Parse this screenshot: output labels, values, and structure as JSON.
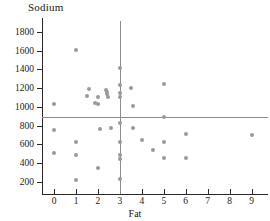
{
  "chart_data": {
    "type": "scatter",
    "title": "Sodium",
    "xlabel": "Fat",
    "ylabel": "Sodium",
    "xlim": [
      -0.55,
      9.75
    ],
    "ylim": [
      75,
      1950
    ],
    "grid": false,
    "legend": null,
    "xticks": [
      0,
      1,
      2,
      3,
      4,
      5,
      6,
      7,
      8,
      9
    ],
    "xtick_labels": [
      "0",
      "1",
      "2",
      "3",
      "4",
      "5",
      "6",
      "7",
      "8",
      "9"
    ],
    "yticks": [
      200,
      400,
      600,
      800,
      1000,
      1200,
      1400,
      1600,
      1800
    ],
    "ytick_labels": [
      "200",
      "400",
      "600",
      "800",
      "1000",
      "1200",
      "1400",
      "1600",
      "1800"
    ],
    "point_color": "#9a9a9a",
    "line_color": "#8e8e8e",
    "axis_color": "#2b2b2b",
    "reference_lines": [
      {
        "orientation": "horizontal",
        "value": 890,
        "label": "mean-sodium"
      },
      {
        "orientation": "vertical",
        "value": 3,
        "label": "mean-fat"
      }
    ],
    "points": [
      {
        "x": 0.0,
        "y": 1035
      },
      {
        "x": 0.0,
        "y": 750
      },
      {
        "x": 0.0,
        "y": 510
      },
      {
        "x": 1.0,
        "y": 1610
      },
      {
        "x": 1.0,
        "y": 630
      },
      {
        "x": 1.0,
        "y": 485
      },
      {
        "x": 1.0,
        "y": 220
      },
      {
        "x": 1.5,
        "y": 1120
      },
      {
        "x": 1.6,
        "y": 1195
      },
      {
        "x": 1.85,
        "y": 1040
      },
      {
        "x": 2.0,
        "y": 1110
      },
      {
        "x": 2.0,
        "y": 1035
      },
      {
        "x": 2.0,
        "y": 345
      },
      {
        "x": 2.1,
        "y": 765
      },
      {
        "x": 2.35,
        "y": 1185
      },
      {
        "x": 2.4,
        "y": 1160
      },
      {
        "x": 2.4,
        "y": 1135
      },
      {
        "x": 2.45,
        "y": 1110
      },
      {
        "x": 2.6,
        "y": 775
      },
      {
        "x": 3.0,
        "y": 1420
      },
      {
        "x": 3.0,
        "y": 1230
      },
      {
        "x": 3.0,
        "y": 1150
      },
      {
        "x": 3.0,
        "y": 1105
      },
      {
        "x": 3.0,
        "y": 830
      },
      {
        "x": 3.0,
        "y": 630
      },
      {
        "x": 3.0,
        "y": 490
      },
      {
        "x": 3.0,
        "y": 440
      },
      {
        "x": 3.0,
        "y": 230
      },
      {
        "x": 3.5,
        "y": 1205
      },
      {
        "x": 3.6,
        "y": 1010
      },
      {
        "x": 3.6,
        "y": 770
      },
      {
        "x": 4.0,
        "y": 650
      },
      {
        "x": 4.5,
        "y": 540
      },
      {
        "x": 5.0,
        "y": 1240
      },
      {
        "x": 5.0,
        "y": 890
      },
      {
        "x": 5.0,
        "y": 620
      },
      {
        "x": 5.0,
        "y": 455
      },
      {
        "x": 6.0,
        "y": 715
      },
      {
        "x": 6.0,
        "y": 450
      },
      {
        "x": 9.0,
        "y": 700
      }
    ]
  }
}
